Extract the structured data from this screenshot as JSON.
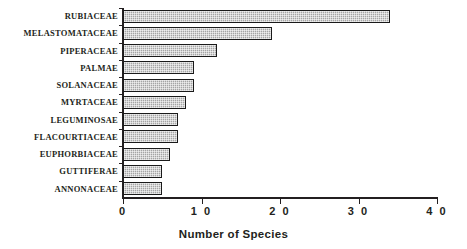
{
  "chart_data": {
    "type": "bar",
    "orientation": "horizontal",
    "title": "",
    "xlabel": "Number of Species",
    "ylabel": "",
    "xlim": [
      0,
      40
    ],
    "xticks": [
      "0",
      "1 0",
      "2 0",
      "3 0",
      "4 0"
    ],
    "xtick_values": [
      0,
      10,
      20,
      30,
      40
    ],
    "grid": false,
    "legend": false,
    "categories": [
      "RUBIACEAE",
      "MELASTOMATACEAE",
      "PIPERACEAE",
      "PALMAE",
      "SOLANACEAE",
      "MYRTACEAE",
      "LEGUMINOSAE",
      "FLACOURTIACEAE",
      "EUPHORBIACEAE",
      "GUTTIFERAE",
      "ANNONACEAE"
    ],
    "values": [
      34,
      19,
      12,
      9,
      9,
      8,
      7,
      7,
      6,
      5,
      5
    ],
    "bar_fill_color": "#a5a5a5",
    "bar_edge_color": "#1a1a1a",
    "axis_color": "#231f20",
    "background_color": "#ffffff"
  }
}
